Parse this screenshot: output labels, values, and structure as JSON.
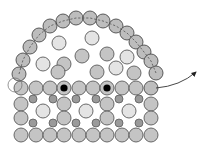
{
  "diagram": {
    "colors": {
      "mid": "#c4c4c4",
      "light": "#e4e4e4",
      "dark": "#9a9a9a",
      "edge": "#bdbdbd",
      "stroke": "#5a5a5a",
      "core": "#000000"
    },
    "radius": 7,
    "small_radius": 4,
    "edge_arc": [
      [
        19,
        74
      ],
      [
        23,
        60
      ],
      [
        30,
        47
      ],
      [
        39,
        35
      ],
      [
        50,
        26
      ],
      [
        63,
        21
      ],
      [
        76,
        18
      ],
      [
        90,
        18
      ],
      [
        103,
        21
      ],
      [
        116,
        26
      ],
      [
        127,
        33
      ],
      [
        136,
        42
      ],
      [
        144,
        52
      ],
      [
        151,
        61
      ],
      [
        156,
        73
      ]
    ],
    "interior_upper": [
      {
        "x": 92,
        "y": 38,
        "type": "light"
      },
      {
        "x": 59,
        "y": 43,
        "type": "light"
      },
      {
        "x": 82,
        "y": 56,
        "type": "mid"
      },
      {
        "x": 107,
        "y": 54,
        "type": "mid"
      },
      {
        "x": 43,
        "y": 64,
        "type": "light"
      },
      {
        "x": 64,
        "y": 64,
        "type": "mid"
      },
      {
        "x": 127,
        "y": 57,
        "type": "light"
      },
      {
        "x": 116,
        "y": 68,
        "type": "light"
      },
      {
        "x": 58,
        "y": 72,
        "type": "mid"
      },
      {
        "x": 97,
        "y": 72,
        "type": "mid"
      },
      {
        "x": 134,
        "y": 73,
        "type": "mid"
      }
    ],
    "lattice_rows": [
      {
        "y": 88,
        "xs": [
          21,
          36,
          50,
          64,
          79,
          93,
          107,
          122,
          136,
          151
        ],
        "types": [
          "mid",
          "mid",
          "mid",
          "core",
          "mid",
          "mid",
          "core",
          "mid",
          "mid",
          "edge"
        ]
      },
      {
        "y": 104,
        "xs": [
          21,
          64,
          107,
          151
        ],
        "types": [
          "mid",
          "mid",
          "mid",
          "mid"
        ]
      },
      {
        "y": 118,
        "xs": [
          21,
          64,
          107,
          151
        ],
        "types": [
          "mid",
          "mid",
          "mid",
          "mid"
        ]
      },
      {
        "y": 135,
        "xs": [
          21,
          36,
          50,
          64,
          79,
          93,
          107,
          122,
          136,
          151
        ],
        "types": [
          "mid",
          "mid",
          "mid",
          "mid",
          "mid",
          "mid",
          "mid",
          "mid",
          "mid",
          "mid"
        ]
      }
    ],
    "light_interstitials": [
      {
        "x": 43,
        "y": 111
      },
      {
        "x": 86,
        "y": 111
      },
      {
        "x": 129,
        "y": 111
      }
    ],
    "small_dark": [
      {
        "x": 33,
        "y": 99
      },
      {
        "x": 53,
        "y": 99
      },
      {
        "x": 76,
        "y": 99
      },
      {
        "x": 96,
        "y": 99
      },
      {
        "x": 119,
        "y": 99
      },
      {
        "x": 139,
        "y": 99
      },
      {
        "x": 33,
        "y": 123
      },
      {
        "x": 53,
        "y": 123
      },
      {
        "x": 76,
        "y": 123
      },
      {
        "x": 96,
        "y": 123
      },
      {
        "x": 119,
        "y": 123
      },
      {
        "x": 139,
        "y": 123
      }
    ],
    "ghost_ring": {
      "x": 15,
      "y": 85
    },
    "arrow": {
      "from": [
        156,
        88
      ],
      "control": [
        180,
        86
      ],
      "to": [
        196,
        72
      ]
    }
  }
}
